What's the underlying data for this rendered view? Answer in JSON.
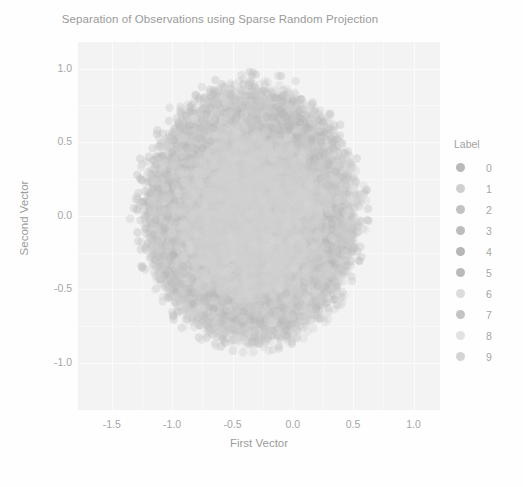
{
  "chart_data": {
    "type": "scatter",
    "title": "Separation of Observations using Sparse Random Projection",
    "xlabel": "First Vector",
    "ylabel": "Second Vector",
    "xlim": [
      -1.78,
      1.22
    ],
    "ylim": [
      -1.32,
      1.18
    ],
    "xticks": [
      "-1.5",
      "-1.0",
      "-0.5",
      "0.0",
      "0.5",
      "1.0"
    ],
    "xtick_values": [
      -1.5,
      -1.0,
      -0.5,
      0.0,
      0.5,
      1.0
    ],
    "yticks": [
      "1.0",
      "0.5",
      "0.0",
      "-0.5",
      "-1.0"
    ],
    "ytick_values": [
      1.0,
      0.5,
      0.0,
      -0.5,
      -1.0
    ],
    "grid": true,
    "grid_color": "#fbfbfb",
    "panel_background": "#f3f3f3",
    "legend_position": "right",
    "legend_title": "Label",
    "point_count": 60000,
    "point_alpha": 0.18,
    "point_radius_px": 4.2,
    "cluster_center": [
      -0.35,
      0.0
    ],
    "cluster_radius": 0.82,
    "cluster_note": "Classes heavily overlap into one dense round cloud; no visible separation.",
    "series": [
      {
        "name": "0",
        "label": "0",
        "color": "#b8b8b8",
        "n": 5923,
        "center": [
          -0.35,
          0.0
        ],
        "spread": 0.4
      },
      {
        "name": "1",
        "label": "1",
        "color": "#c9c9c9",
        "n": 6742,
        "center": [
          -0.33,
          0.02
        ],
        "spread": 0.41
      },
      {
        "name": "2",
        "label": "2",
        "color": "#bdbdbd",
        "n": 5958,
        "center": [
          -0.37,
          -0.02
        ],
        "spread": 0.4
      },
      {
        "name": "3",
        "label": "3",
        "color": "#b4b4b4",
        "n": 6131,
        "center": [
          -0.34,
          0.03
        ],
        "spread": 0.42
      },
      {
        "name": "4",
        "label": "4",
        "color": "#b0b0b0",
        "n": 5842,
        "center": [
          -0.36,
          -0.01
        ],
        "spread": 0.4
      },
      {
        "name": "5",
        "label": "5",
        "color": "#b6b6b6",
        "n": 5421,
        "center": [
          -0.35,
          0.01
        ],
        "spread": 0.41
      },
      {
        "name": "6",
        "label": "6",
        "color": "#d2d2d2",
        "n": 5918,
        "center": [
          -0.34,
          -0.03
        ],
        "spread": 0.4
      },
      {
        "name": "7",
        "label": "7",
        "color": "#bfbfbf",
        "n": 6265,
        "center": [
          -0.36,
          0.02
        ],
        "spread": 0.42
      },
      {
        "name": "8",
        "label": "8",
        "color": "#dadada",
        "n": 5851,
        "center": [
          -0.35,
          -0.01
        ],
        "spread": 0.4
      },
      {
        "name": "9",
        "label": "9",
        "color": "#cdcdcd",
        "n": 5949,
        "center": [
          -0.33,
          0.0
        ],
        "spread": 0.41
      }
    ]
  },
  "legend": {
    "title": "Label",
    "entries": [
      {
        "label": "0",
        "color": "#b8b8b8"
      },
      {
        "label": "1",
        "color": "#cfcfcf"
      },
      {
        "label": "2",
        "color": "#c2c2c2"
      },
      {
        "label": "3",
        "color": "#bcbcbc"
      },
      {
        "label": "4",
        "color": "#b6b6b6"
      },
      {
        "label": "5",
        "color": "#bababa"
      },
      {
        "label": "6",
        "color": "#dcdcdc"
      },
      {
        "label": "7",
        "color": "#c4c4c4"
      },
      {
        "label": "8",
        "color": "#e2e2e2"
      },
      {
        "label": "9",
        "color": "#d4d4d4"
      }
    ]
  }
}
